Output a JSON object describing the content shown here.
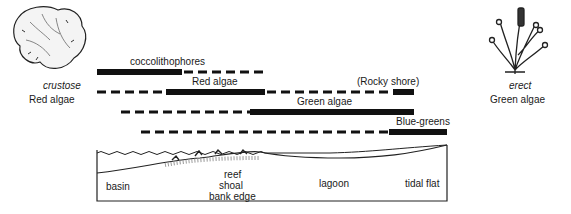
{
  "left_figure": {
    "form": "crustose",
    "name": "Red algae"
  },
  "right_figure": {
    "form": "erect",
    "name": "Green algae"
  },
  "distribution_bars": [
    {
      "label": "coccolithophores",
      "segments": [
        {
          "x1": 97,
          "x2": 182,
          "style": "solid"
        },
        {
          "x1": 182,
          "x2": 265,
          "style": "dashed"
        }
      ]
    },
    {
      "label": "Red algae",
      "note": "(Rocky shore)",
      "segments": [
        {
          "x1": 97,
          "x2": 166,
          "style": "dashed"
        },
        {
          "x1": 166,
          "x2": 265,
          "style": "solid"
        },
        {
          "x1": 265,
          "x2": 393,
          "style": "dashed"
        },
        {
          "x1": 393,
          "x2": 414,
          "style": "solid"
        }
      ]
    },
    {
      "label": "Green algae",
      "segments": [
        {
          "x1": 121,
          "x2": 250,
          "style": "dashed"
        },
        {
          "x1": 250,
          "x2": 414,
          "style": "solid"
        }
      ]
    },
    {
      "label": "Blue-greens",
      "segments": [
        {
          "x1": 141,
          "x2": 389,
          "style": "dashed"
        },
        {
          "x1": 389,
          "x2": 447,
          "style": "solid"
        }
      ]
    }
  ],
  "cross_section": {
    "zones": [
      "basin",
      "reef",
      "shoal",
      "bank edge",
      "lagoon",
      "tidal flat"
    ]
  }
}
